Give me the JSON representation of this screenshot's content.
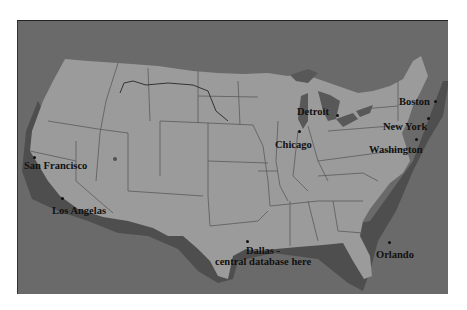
{
  "map": {
    "subject": "United States",
    "colors": {
      "ocean": "#6a6a6a",
      "land": "#9b9b9b",
      "shadow": "#4e4e4e",
      "borders": "#5a5a5a",
      "label": "#111111"
    },
    "cities": [
      {
        "id": "san-francisco",
        "label": "San Francisco",
        "dot": [
          15,
          135
        ],
        "text": [
          10,
          146
        ]
      },
      {
        "id": "los-angeles",
        "label": "Los Angelas",
        "dot": [
          44,
          178
        ],
        "text": [
          34,
          183
        ]
      },
      {
        "id": "detroit",
        "label": "Detroit",
        "dot": [
          79,
          94
        ],
        "text": [
          40,
          85
        ]
      },
      {
        "id": "chicago",
        "label": "Chicago",
        "dot": [
          -4,
          110
        ],
        "text": [
          -9,
          117
        ]
      },
      {
        "id": "boston",
        "label": "Boston",
        "dot": [
          176,
          80
        ],
        "text": [
          141,
          75
        ]
      },
      {
        "id": "new-york",
        "label": "New York",
        "dot": [
          170,
          96
        ],
        "text": [
          125,
          101
        ]
      },
      {
        "id": "washington",
        "label": "Washington",
        "dot": [
          158,
          117
        ],
        "text": [
          112,
          124
        ]
      },
      {
        "id": "dallas",
        "label": "Dallas -\ncentral database here",
        "label_line1": "Dallas -",
        "label_line2": "central database here",
        "dot": [
          6,
          228
        ],
        "text": [
          -35,
          233
        ]
      },
      {
        "id": "orlando",
        "label": "Orlando",
        "dot": [
          131,
          241
        ],
        "text": [
          119,
          247
        ]
      }
    ]
  }
}
